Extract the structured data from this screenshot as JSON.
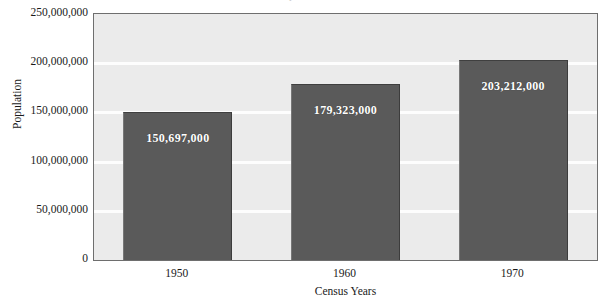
{
  "chart_data": {
    "type": "bar",
    "title": "",
    "xlabel": "Census Years",
    "ylabel": "Population",
    "categories": [
      "1950",
      "1960",
      "1970"
    ],
    "values": [
      150697000,
      179323000,
      203212000
    ],
    "value_labels": [
      "150,697,000",
      "179,323,000",
      "203,212,000"
    ],
    "ylim": [
      0,
      250000000
    ],
    "ytick_values": [
      0,
      50000000,
      100000000,
      150000000,
      200000000,
      250000000
    ],
    "ytick_labels": [
      "0",
      "50,000,000",
      "100,000,000",
      "150,000,000",
      "200,000,000",
      "250,000,000"
    ],
    "grid": true,
    "legend": "none",
    "series": [
      {
        "name": "Population",
        "values": [
          150697000,
          179323000,
          203212000
        ]
      }
    ],
    "colors": {
      "bar_fill": "#5a5a5a",
      "plot_background": "#ebebeb",
      "gridline": "#fdfdfd",
      "axis_border": "#6e6e6e",
      "value_label_text": "#ffffff",
      "axis_text": "#1a1a1a"
    }
  },
  "figure": {
    "title_remnant": "Population"
  }
}
